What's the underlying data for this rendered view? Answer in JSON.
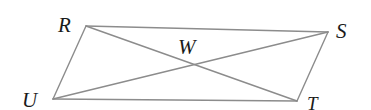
{
  "figure": {
    "type": "geometry-diagram",
    "shape": "parallelogram-with-diagonals",
    "background_color": "#ffffff",
    "stroke_color": "#8c8c8c",
    "label_color": "#1a1a1a",
    "stroke_width": 1.4,
    "canvas": {
      "width": 371,
      "height": 110
    }
  },
  "vertices": [
    {
      "name": "R",
      "label": "R",
      "x": 86,
      "y": 26,
      "label_x": 58,
      "label_y": 15,
      "size": "big"
    },
    {
      "name": "S",
      "label": "S",
      "x": 328,
      "y": 32,
      "label_x": 336,
      "label_y": 21,
      "size": "big"
    },
    {
      "name": "T",
      "label": "T",
      "x": 297,
      "y": 101,
      "label_x": 307,
      "label_y": 94,
      "size": "mid"
    },
    {
      "name": "U",
      "label": "U",
      "x": 53,
      "y": 99,
      "label_x": 22,
      "label_y": 90,
      "size": "big"
    },
    {
      "name": "W",
      "label": "W",
      "x": 190,
      "y": 65,
      "label_x": 178,
      "label_y": 37,
      "size": "big"
    }
  ],
  "edges": [
    {
      "name": "side-RS",
      "from": "R",
      "to": "S"
    },
    {
      "name": "side-ST",
      "from": "S",
      "to": "T"
    },
    {
      "name": "side-TU",
      "from": "T",
      "to": "U"
    },
    {
      "name": "side-UR",
      "from": "U",
      "to": "R"
    },
    {
      "name": "diagonal-RT",
      "from": "R",
      "to": "T"
    },
    {
      "name": "diagonal-SU",
      "from": "S",
      "to": "U"
    }
  ],
  "intersection": {
    "name": "W",
    "x": 190,
    "y": 65
  }
}
